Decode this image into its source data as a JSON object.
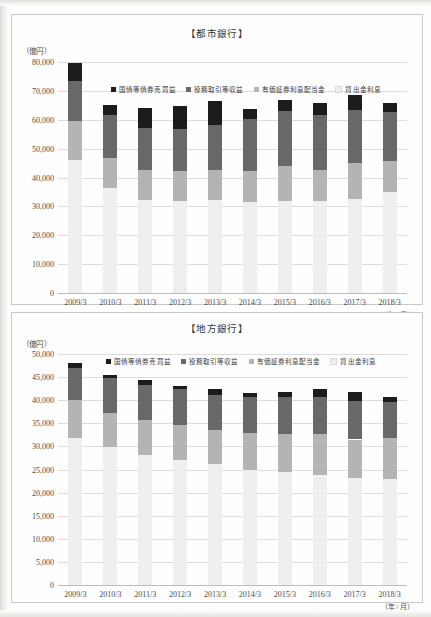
{
  "page": {
    "unit_label": "（億円）",
    "axis_note": "（年 / 月）"
  },
  "series_names": {
    "bond": "国債等債券売買益",
    "fees": "役務取引等収益",
    "securities": "有価証券利息配当金",
    "loans": "貸出金利息"
  },
  "colors": {
    "bond": "#1c1c1c",
    "fees": "#686868",
    "securities": "#b4b4b4",
    "loans": "#efefef",
    "gridline": "#dcdcdc",
    "axis": "#bdbdbd",
    "text": "#4d4d4d"
  },
  "chart_data": [
    {
      "type": "bar",
      "stacked": true,
      "title": "【都市銀行】",
      "xlabel": "（年 / 月）",
      "ylabel": "（億円）",
      "ylim": [
        0,
        80000
      ],
      "ytick_step": 10000,
      "yticks": [
        "0",
        "10,000",
        "20,000",
        "30,000",
        "40,000",
        "50,000",
        "60,000",
        "70,000",
        "80,000"
      ],
      "grid": true,
      "legend_position": "top-center-inside",
      "categories": [
        "2009/3",
        "2010/3",
        "2011/3",
        "2012/3",
        "2013/3",
        "2014/3",
        "2015/3",
        "2016/3",
        "2017/3",
        "2018/3"
      ],
      "series": [
        {
          "name": "貸出金利息",
          "key": "loans",
          "values": [
            46100,
            36300,
            32200,
            31700,
            32100,
            31600,
            31700,
            31800,
            32500,
            35000
          ]
        },
        {
          "name": "有価証券利息配当金",
          "key": "securities",
          "values": [
            13400,
            10600,
            10500,
            10600,
            10500,
            10700,
            12400,
            10800,
            12400,
            10800
          ]
        },
        {
          "name": "役務取引等収益",
          "key": "fees",
          "values": [
            14100,
            14800,
            14300,
            14600,
            15500,
            17900,
            19000,
            18900,
            18500,
            17000
          ]
        },
        {
          "name": "国債等債券売買益",
          "key": "bond",
          "values": [
            5900,
            3300,
            7100,
            7800,
            8400,
            3400,
            3800,
            4400,
            5100,
            3000
          ]
        }
      ]
    },
    {
      "type": "bar",
      "stacked": true,
      "title": "【地方銀行】",
      "xlabel": "（年 / 月）",
      "ylabel": "（億円）",
      "ylim": [
        0,
        50000
      ],
      "ytick_step": 5000,
      "yticks": [
        "0",
        "5,000",
        "10,000",
        "15,000",
        "20,000",
        "25,000",
        "30,000",
        "35,000",
        "40,000",
        "45,000",
        "50,000"
      ],
      "grid": true,
      "legend_position": "top-center-inside",
      "categories": [
        "2009/3",
        "2010/3",
        "2011/3",
        "2012/3",
        "2013/3",
        "2014/3",
        "2015/3",
        "2016/3",
        "2017/3",
        "2018/3"
      ],
      "series": [
        {
          "name": "貸出金利息",
          "key": "loans",
          "values": [
            31900,
            29800,
            28100,
            27100,
            26300,
            24900,
            24500,
            23800,
            23100,
            23000
          ]
        },
        {
          "name": "有価証券利息配当金",
          "key": "securities",
          "values": [
            8100,
            7400,
            7700,
            7600,
            7300,
            8100,
            8200,
            8800,
            8400,
            8900
          ]
        },
        {
          "name": "役務取引等収益",
          "key": "fees",
          "values": [
            6900,
            7600,
            7500,
            7700,
            7600,
            7600,
            7900,
            8100,
            8300,
            7800
          ]
        },
        {
          "name": "国債等債券売買益",
          "key": "bond",
          "values": [
            1200,
            600,
            1100,
            600,
            1300,
            1000,
            1100,
            1800,
            2000,
            1000
          ]
        }
      ]
    }
  ]
}
